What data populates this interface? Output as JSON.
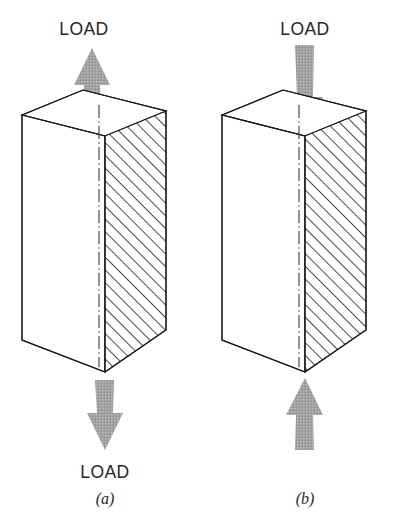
{
  "figure": {
    "background_color": "#ffffff",
    "line_color": "#1a1a1a",
    "arrow_color": "#a3a3a3",
    "hatch_color": "#2b2b2b",
    "text_color": "#262626"
  },
  "panels": [
    {
      "id": "a",
      "caption": "(a)",
      "loading_mode": "tension",
      "top_label": "LOAD",
      "bottom_label": "LOAD",
      "top_arrow": {
        "icon": "arrow-up-icon",
        "direction": "up",
        "points": "away-from-body"
      },
      "bottom_arrow": {
        "icon": "arrow-down-icon",
        "direction": "down",
        "points": "away-from-body"
      },
      "solid": {
        "shape": "rectangular-prism",
        "visible_faces": [
          "top",
          "front-left",
          "front-right-hatched"
        ],
        "hatched_face": "front-right",
        "hatch_angle_deg": 45,
        "centerline_style": "dash-dot"
      }
    },
    {
      "id": "b",
      "caption": "(b)",
      "loading_mode": "compression",
      "top_label": "LOAD",
      "bottom_label": "",
      "top_arrow": {
        "icon": "arrow-down-icon",
        "direction": "down",
        "points": "into-body"
      },
      "bottom_arrow": {
        "icon": "arrow-up-icon",
        "direction": "up",
        "points": "into-body"
      },
      "solid": {
        "shape": "rectangular-prism",
        "visible_faces": [
          "top",
          "front-left",
          "front-right-hatched"
        ],
        "hatched_face": "front-right",
        "hatch_angle_deg": 45,
        "centerline_style": "dash-dot"
      }
    }
  ]
}
